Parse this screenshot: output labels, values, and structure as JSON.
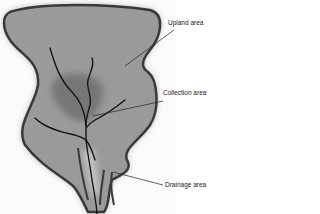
{
  "diagram": {
    "type": "watershed",
    "labels": {
      "upland": "Upland area",
      "collection": "Collection area",
      "drainage": "Drainage area"
    },
    "colors": {
      "background": "#ffffff",
      "basin_fill": "#9a9a9a",
      "basin_outline": "#333333",
      "collection_fill": "#6e6e6e",
      "stream": "#111111",
      "leader_line": "#222222",
      "label_text": "#1a1a1a"
    }
  }
}
